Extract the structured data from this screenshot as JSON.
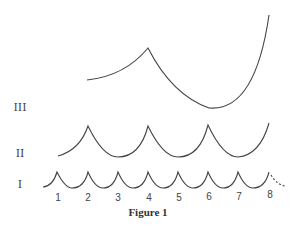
{
  "caption": "Figure 1",
  "rows": {
    "III": "III",
    "II": "II",
    "I": "I"
  },
  "ticks": [
    "1",
    "2",
    "3",
    "4",
    "5",
    "6",
    "7",
    "8"
  ],
  "colors": {
    "stroke": "#444444",
    "background": "#ffffff"
  },
  "curves": {
    "row_I": {
      "description": "Scalloped curve with cusps at positions 1 through 8, dashed continuation after 8",
      "cusp_positions": [
        1,
        2,
        3,
        4,
        5,
        6,
        7,
        8
      ]
    },
    "row_II": {
      "description": "Scalloped curve with cusps at positions 2, 4, 6, rising at 8",
      "cusp_positions": [
        2,
        4,
        6
      ]
    },
    "row_III": {
      "description": "Curve rising from 2 to a cusp at 4, descending to a minimum near 6, then rising steeply to 8",
      "cusp_positions": [
        4
      ]
    }
  }
}
